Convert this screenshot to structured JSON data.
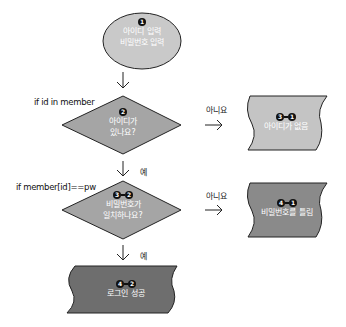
{
  "nodes": {
    "start": {
      "step": [
        "1"
      ],
      "lines": [
        "아이디 입력",
        "비밀번호 입력"
      ]
    },
    "check_id": {
      "step": [
        "2"
      ],
      "lines": [
        "아이디가",
        "있나요?"
      ],
      "condition": "if id in member"
    },
    "no_id": {
      "step": [
        "3",
        "1"
      ],
      "lines": [
        "아이디가 없음"
      ]
    },
    "check_pw": {
      "step": [
        "3",
        "2"
      ],
      "lines": [
        "비밀번호가",
        "일치하나요?"
      ],
      "condition": "if member[id]==pw"
    },
    "wrong_pw": {
      "step": [
        "4",
        "1"
      ],
      "lines": [
        "비밀번호를 틀림"
      ]
    },
    "success": {
      "step": [
        "4",
        "2"
      ],
      "lines": [
        "로그인 성공"
      ]
    }
  },
  "edges": {
    "no_label_1": "아니요",
    "yes_label_1": "예",
    "no_label_2": "아니요",
    "yes_label_2": "예"
  },
  "colors": {
    "start_fill": "#c9c9c9",
    "diamond_fill": "#a5a5a5",
    "no_id_fill": "#c4c4c4",
    "wrong_pw_fill": "#8a8a8a",
    "success_fill": "#6e6e6e"
  }
}
